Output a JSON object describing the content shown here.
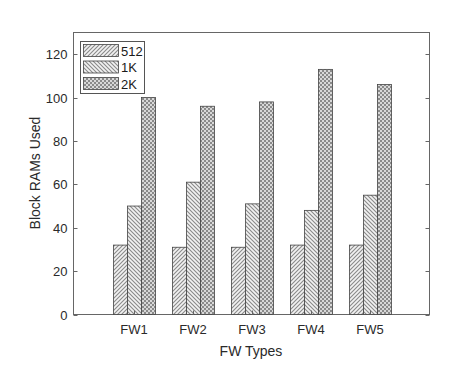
{
  "chart_data": {
    "type": "bar",
    "title": "",
    "xlabel": "FW Types",
    "ylabel": "Block RAMs Used",
    "categories": [
      "FW1",
      "FW2",
      "FW3",
      "FW4",
      "FW5"
    ],
    "series": [
      {
        "name": "512",
        "pattern": "diagonal-forward",
        "values": [
          32,
          31,
          31,
          32,
          32
        ]
      },
      {
        "name": "1K",
        "pattern": "diagonal-backward",
        "values": [
          50,
          61,
          51,
          48,
          55
        ]
      },
      {
        "name": "2K",
        "pattern": "crosshatch",
        "values": [
          100,
          96,
          98,
          113,
          106
        ]
      }
    ],
    "ylim": [
      0,
      130
    ],
    "yticks": [
      0,
      20,
      40,
      60,
      80,
      100,
      120
    ],
    "ytick_labels": [
      "0",
      "20",
      "40",
      "60",
      "80",
      "100",
      "120"
    ],
    "grid": false,
    "legend_position": "upper-left",
    "colors": {
      "axis": "#555555",
      "bar_edge": "#444444",
      "pattern_light": "#bdbdbd",
      "pattern_dark": "#7a7a7a"
    }
  }
}
